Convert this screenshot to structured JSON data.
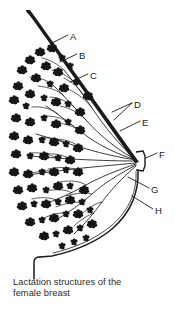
{
  "figure": {
    "title": "Lactation structures of the female breast",
    "caption_line_1": "Lactation structures of the",
    "caption_line_2": "female breast",
    "type": "anatomical-line-diagram",
    "orientation": "sagittal cross-section, nipple pointing right",
    "background_color": "#ffffff",
    "ink_color": "#1a1a1a"
  },
  "labels": [
    {
      "id": "A",
      "text": "A",
      "x": 71,
      "y": 37
    },
    {
      "id": "B",
      "text": "B",
      "x": 80,
      "y": 56
    },
    {
      "id": "C",
      "text": "C",
      "x": 91,
      "y": 76
    },
    {
      "id": "D",
      "text": "D",
      "x": 135,
      "y": 105
    },
    {
      "id": "E",
      "text": "E",
      "x": 143,
      "y": 123
    },
    {
      "id": "F",
      "text": "F",
      "x": 160,
      "y": 155
    },
    {
      "id": "G",
      "text": "G",
      "x": 152,
      "y": 190
    },
    {
      "id": "H",
      "text": "H",
      "x": 156,
      "y": 211
    }
  ],
  "structures": {
    "chest_wall_line": "tapering diagonal line from upper-left to nipple region",
    "nipple": "convergence point of all lactiferous ducts at right",
    "lobules": "dark stippled clusters of alveoli filling left two-thirds",
    "ducts": "branching lines radiating from nipple to lobules",
    "breast_outline": "curved contour sweeping from nipple down and left to chest wall"
  }
}
